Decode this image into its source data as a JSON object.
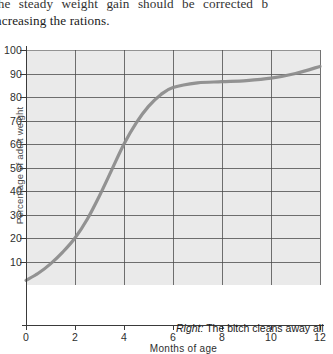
{
  "body_text": {
    "line1": "the  steady  weight  gain  should  be  corrected  b",
    "line2": "ncreasing the rations."
  },
  "caption": {
    "lead": "Right:",
    "text": " The bitch cleans away all"
  },
  "colors": {
    "plot_background": "#eaeaea",
    "gridline": "#4a4a4a",
    "axis": "#3a3a3a",
    "curve": "#8a8a8a",
    "text": "#1b1b1b"
  },
  "chart_data": {
    "type": "line",
    "title": "",
    "xlabel": "Months of age",
    "ylabel": "Percentage of adult weight",
    "xlim": [
      0,
      12
    ],
    "ylim": [
      0,
      100
    ],
    "xticks": [
      "0",
      "2",
      "4",
      "6",
      "8",
      "10",
      "12"
    ],
    "yticks": [
      "10",
      "20",
      "30",
      "40",
      "50",
      "60",
      "70",
      "80",
      "90",
      "100"
    ],
    "grid": true,
    "legend": "none",
    "x": [
      0,
      0.5,
      1,
      1.5,
      2,
      2.5,
      3,
      3.5,
      4,
      4.5,
      5,
      5.5,
      6,
      7,
      8,
      9,
      10,
      11,
      12
    ],
    "values": [
      2,
      5,
      9,
      14,
      20,
      28,
      38,
      49,
      60,
      69,
      76,
      81,
      84,
      86,
      86.5,
      87,
      88,
      90,
      93
    ],
    "series": [
      {
        "name": "Puppy growth curve",
        "values": [
          2,
          5,
          9,
          14,
          20,
          28,
          38,
          49,
          60,
          69,
          76,
          81,
          84,
          86,
          86.5,
          87,
          88,
          90,
          93
        ]
      }
    ]
  }
}
